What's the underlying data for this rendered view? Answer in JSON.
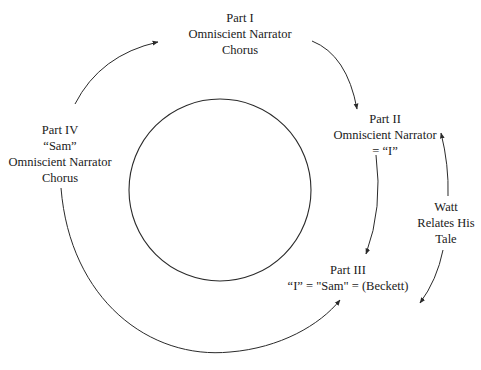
{
  "diagram": {
    "nodes": [
      {
        "id": "part-1",
        "lines": [
          "Part I",
          "Omniscient Narrator",
          "Chorus"
        ]
      },
      {
        "id": "part-2",
        "lines": [
          "Part II",
          "Omniscient Narrator",
          "= “I”"
        ]
      },
      {
        "id": "part-3",
        "lines": [
          "Part III",
          "“I” = \"Sam\" = (Beckett)"
        ]
      },
      {
        "id": "part-4",
        "lines": [
          "Part IV",
          "“Sam”",
          "Omniscient Narrator",
          "Chorus"
        ]
      },
      {
        "id": "watt",
        "lines": [
          "Watt",
          "Relates His",
          "Tale"
        ]
      }
    ],
    "edges": [
      {
        "from": "part-4",
        "to": "part-1"
      },
      {
        "from": "part-1",
        "to": "part-2"
      },
      {
        "from": "part-2",
        "to": "part-3"
      },
      {
        "from": "part-4",
        "to": "part-3"
      },
      {
        "from": "watt",
        "to": "part-2"
      },
      {
        "from": "watt",
        "to": "part-3"
      }
    ],
    "center_shape": "circle",
    "stroke_color": "#2a2a2a"
  }
}
